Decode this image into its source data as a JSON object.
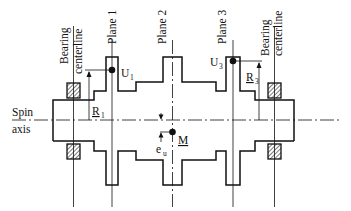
{
  "diagram": {
    "type": "rotor-balancing-schematic",
    "labels": {
      "bearing_left_line1": "Bearing",
      "bearing_left_line2": "centerline",
      "bearing_right_line1": "Bearing",
      "bearing_right_line2": "centerline",
      "plane1": "Plane 1",
      "plane2": "Plane 2",
      "plane3": "Plane 3",
      "spin_line1": "Spin",
      "spin_line2": "axis",
      "u1_main": "U",
      "u1_sub": "1",
      "u3_main": "U",
      "u3_sub": "3",
      "r1_main": "R",
      "r1_sub": "1",
      "r3_main": "R",
      "r3_sub": "3",
      "m_main": "M",
      "eu_main": "e",
      "eu_sub": "u"
    },
    "colors": {
      "stroke": "#111111",
      "background": "#ffffff"
    }
  }
}
